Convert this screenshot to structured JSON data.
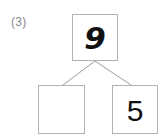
{
  "question": {
    "number_label": "(3)"
  },
  "diagram": {
    "type": "number-bond",
    "colors": {
      "box_border": "#b2b2b2",
      "connector_line": "#9a9a9a",
      "number_text": "#111111",
      "label_text": "#8a8a8a",
      "background": "#ffffff"
    },
    "nodes": {
      "whole": {
        "name": "whole-box",
        "value": "9",
        "filled": true
      },
      "part_left": {
        "name": "part-box-left",
        "value": "",
        "filled": false
      },
      "part_right": {
        "name": "part-box-right",
        "value": "5",
        "filled": true
      }
    },
    "connectors": [
      {
        "from": "whole",
        "to": "part_left"
      },
      {
        "from": "whole",
        "to": "part_right"
      }
    ]
  }
}
